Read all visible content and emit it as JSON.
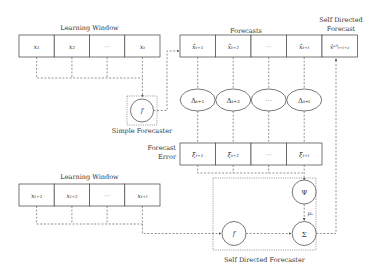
{
  "top_window": {
    "label": "Learning Window",
    "cells": [
      "x₁",
      "x₂",
      "···",
      "xₜ"
    ]
  },
  "simple_forecaster": {
    "label": "Simple Forecaster",
    "symbol": "f"
  },
  "forecasts": {
    "label": "Forecasts",
    "cells": [
      "x̂ₜ₊₁",
      "x̂ₜ₊₂",
      "···",
      "x̂ₜ₊ₗ"
    ]
  },
  "sd_forecast": {
    "label_line1": "Self Directed",
    "label_line2": "Forecast",
    "cell": "x̂ˢᴰₜ₊ₗ₊₁"
  },
  "deltas": [
    "Δₜ₊₁",
    "Δₜ₊₂",
    "···",
    "Δₜ₊ₗ"
  ],
  "forecast_error": {
    "label_line1": "Forecast",
    "label_line2": "Error",
    "cells": [
      "ξₜ₊₁",
      "ξₜ₊₂",
      "···",
      "ξₜ₊ₗ"
    ]
  },
  "bottom_window": {
    "label": "Learning Window",
    "cells": [
      "xₗ₊₁",
      "xₗ₊₂",
      "···",
      "xₜ₊ₗ"
    ]
  },
  "sd_forecaster": {
    "label": "Self Directed Forecaster",
    "f_symbol": "f",
    "psi_symbol": "Ψ",
    "sigma_symbol": "Σ",
    "mu_label": "μₛ"
  }
}
